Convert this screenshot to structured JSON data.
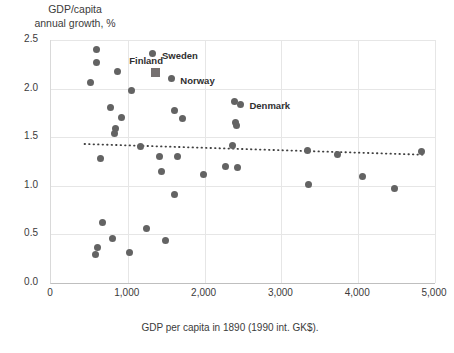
{
  "chart_data": {
    "type": "scatter",
    "title": "",
    "ylabel": "GDP/capita\nannual growth, %",
    "xlabel": "GDP per capita in 1890 (1990 int. GK$).",
    "xlim": [
      0,
      5000
    ],
    "ylim": [
      0.0,
      2.5
    ],
    "xticks": [
      "0",
      "1,000",
      "2,000",
      "3,000",
      "4,000",
      "5,000"
    ],
    "xtick_values": [
      0,
      1000,
      2000,
      3000,
      4000,
      5000
    ],
    "yticks": [
      "0.0",
      "0.5",
      "1.0",
      "1.5",
      "2.0",
      "2.5"
    ],
    "ytick_values": [
      0.0,
      0.5,
      1.0,
      1.5,
      2.0,
      2.5
    ],
    "grid": true,
    "legend": "none",
    "marker_color": "#636363",
    "highlight_color": "#767171",
    "trendline": {
      "type": "linear",
      "style": "dotted",
      "color": "#3f3f3f",
      "x_start": 450,
      "y_start": 1.43,
      "x_end": 4850,
      "y_end": 1.32
    },
    "points": [
      {
        "x": 610,
        "y": 2.4,
        "label": ""
      },
      {
        "x": 600,
        "y": 2.27,
        "label": ""
      },
      {
        "x": 880,
        "y": 2.18,
        "label": ""
      },
      {
        "x": 530,
        "y": 2.06,
        "label": ""
      },
      {
        "x": 1340,
        "y": 2.36,
        "label": "Sweden"
      },
      {
        "x": 1370,
        "y": 2.17,
        "label": "Finland",
        "marker": "square"
      },
      {
        "x": 1580,
        "y": 2.1,
        "label": "Norway"
      },
      {
        "x": 1060,
        "y": 1.98,
        "label": ""
      },
      {
        "x": 790,
        "y": 1.81,
        "label": ""
      },
      {
        "x": 1620,
        "y": 1.77,
        "label": ""
      },
      {
        "x": 2400,
        "y": 1.87,
        "label": ""
      },
      {
        "x": 2480,
        "y": 1.84,
        "label": "Denmark"
      },
      {
        "x": 930,
        "y": 1.7,
        "label": ""
      },
      {
        "x": 1720,
        "y": 1.69,
        "label": ""
      },
      {
        "x": 2410,
        "y": 1.65,
        "label": ""
      },
      {
        "x": 2430,
        "y": 1.62,
        "label": ""
      },
      {
        "x": 850,
        "y": 1.59,
        "label": ""
      },
      {
        "x": 840,
        "y": 1.54,
        "label": ""
      },
      {
        "x": 1180,
        "y": 1.4,
        "label": ""
      },
      {
        "x": 2370,
        "y": 1.41,
        "label": ""
      },
      {
        "x": 3350,
        "y": 1.36,
        "label": ""
      },
      {
        "x": 3740,
        "y": 1.32,
        "label": ""
      },
      {
        "x": 4840,
        "y": 1.35,
        "label": ""
      },
      {
        "x": 660,
        "y": 1.28,
        "label": ""
      },
      {
        "x": 1420,
        "y": 1.3,
        "label": ""
      },
      {
        "x": 1660,
        "y": 1.3,
        "label": ""
      },
      {
        "x": 1450,
        "y": 1.15,
        "label": ""
      },
      {
        "x": 2000,
        "y": 1.12,
        "label": ""
      },
      {
        "x": 2280,
        "y": 1.2,
        "label": ""
      },
      {
        "x": 2440,
        "y": 1.19,
        "label": ""
      },
      {
        "x": 3370,
        "y": 1.01,
        "label": ""
      },
      {
        "x": 4070,
        "y": 1.1,
        "label": ""
      },
      {
        "x": 4490,
        "y": 0.97,
        "label": ""
      },
      {
        "x": 1620,
        "y": 0.91,
        "label": ""
      },
      {
        "x": 1250,
        "y": 0.56,
        "label": ""
      },
      {
        "x": 690,
        "y": 0.62,
        "label": ""
      },
      {
        "x": 820,
        "y": 0.46,
        "label": ""
      },
      {
        "x": 1510,
        "y": 0.44,
        "label": ""
      },
      {
        "x": 620,
        "y": 0.37,
        "label": ""
      },
      {
        "x": 1030,
        "y": 0.31,
        "label": ""
      },
      {
        "x": 590,
        "y": 0.29,
        "label": ""
      }
    ]
  }
}
